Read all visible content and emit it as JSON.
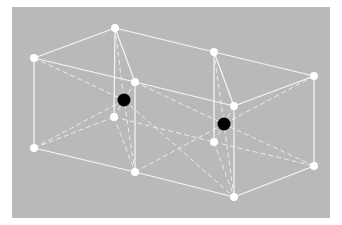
{
  "figure": {
    "title": "",
    "background_color": "#b9b9b9",
    "edge_color": "#ffffff",
    "corner_atom_color": "#ffffff",
    "center_atom_color": "#000000"
  },
  "nodes": {
    "corner_atoms": [
      {
        "id": "A",
        "x": 34,
        "y": 58
      },
      {
        "id": "B",
        "x": 115,
        "y": 28
      },
      {
        "id": "C",
        "x": 214,
        "y": 52
      },
      {
        "id": "D",
        "x": 314,
        "y": 76
      },
      {
        "id": "E",
        "x": 135,
        "y": 82
      },
      {
        "id": "F",
        "x": 234,
        "y": 106
      },
      {
        "id": "G",
        "x": 34,
        "y": 148
      },
      {
        "id": "H",
        "x": 114,
        "y": 117
      },
      {
        "id": "I",
        "x": 214,
        "y": 142
      },
      {
        "id": "J",
        "x": 314,
        "y": 166
      },
      {
        "id": "K",
        "x": 135,
        "y": 172
      },
      {
        "id": "L",
        "x": 234,
        "y": 197
      }
    ],
    "center_atoms": [
      {
        "id": "M1",
        "x": 124,
        "y": 100
      },
      {
        "id": "M2",
        "x": 224,
        "y": 124
      }
    ]
  }
}
